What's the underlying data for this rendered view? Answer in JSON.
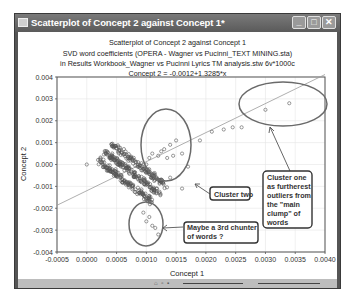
{
  "window": {
    "title": "Scatterplot of Concept 2 against Concept 1*",
    "controls": {
      "minimize": "_",
      "maximize": "□",
      "close": "✕"
    }
  },
  "header": {
    "line1": "Scatterplot of Concept 2 against Concept 1",
    "line2": "SVD word coefficients (OPERA - Wagner vs Pucinni_TEXT MINING.sta)",
    "line3": "in Results Workbook_Wagner vs Pucinni Lyrics TM analysis.stw 6v*1000c",
    "line4": "Concept 2 = -0.0012+1.3285*x"
  },
  "annotations": {
    "cluster_one": [
      "Cluster one",
      "as furtherest",
      "outliers from",
      "the \"main",
      "clump\" of",
      "words"
    ],
    "cluster_two": "Cluster two",
    "cluster_three": [
      "Maybe a 3rd chunter",
      "of words ?"
    ]
  },
  "colors": {
    "point": "#555555",
    "ellipse": "#6a6a6a",
    "fit_line": "#9a9a9a",
    "grid": "#e6e6e6"
  },
  "chart_data": {
    "type": "scatter",
    "title": "Scatterplot of Concept 2 against Concept 1",
    "subtitle": "SVD word coefficients (OPERA - Wagner vs Pucinni_TEXT MINING.sta) in Results Workbook_Wagner vs Pucinni Lyrics TM analysis.stw 6v*1000c",
    "fit_equation": "Concept 2 = -0.0012+1.3285*x",
    "fit": {
      "intercept": -0.0012,
      "slope": 1.3285
    },
    "xlabel": "Concept 1",
    "ylabel": "Concept 2",
    "xlim": [
      -0.0005,
      0.004
    ],
    "ylim": [
      -0.004,
      0.004
    ],
    "x_ticks": [
      "-0.0005",
      "0.0000",
      "0.0005",
      "0.0010",
      "0.0015",
      "0.0020",
      "0.0025",
      "0.0030",
      "0.0035",
      "0.0040"
    ],
    "y_ticks": [
      "0.004",
      "0.003",
      "0.002",
      "0.001",
      "0.000",
      "-0.001",
      "-0.002",
      "-0.003",
      "-0.004"
    ],
    "grid": true,
    "outlier_cluster_points": [
      [
        0.0019,
        0.0011
      ],
      [
        0.0021,
        0.0015
      ],
      [
        0.0023,
        0.0016
      ],
      [
        0.00245,
        0.0017
      ],
      [
        0.0026,
        0.0017
      ],
      [
        0.003,
        0.0025
      ],
      [
        0.0034,
        0.0028
      ]
    ],
    "cluster_two_points": [
      [
        0.001,
        0.0
      ],
      [
        0.00105,
        0.0003
      ],
      [
        0.0011,
        0.0005
      ],
      [
        0.0012,
        0.0004
      ],
      [
        0.00125,
        0.0006
      ],
      [
        0.0013,
        0.0007
      ],
      [
        0.00135,
        0.0003
      ],
      [
        0.0014,
        0.0009
      ],
      [
        0.00145,
        0.0004
      ],
      [
        0.0015,
        0.0011
      ],
      [
        0.0016,
        0.0005
      ],
      [
        0.0017,
        -0.0001
      ],
      [
        0.00125,
        -0.0007
      ],
      [
        0.0014,
        -0.0006
      ],
      [
        0.0016,
        -0.0011
      ]
    ],
    "cluster_three_points": [
      [
        0.00095,
        -0.0022
      ],
      [
        0.001,
        -0.0026
      ],
      [
        0.00105,
        -0.0024
      ],
      [
        0.0011,
        -0.0028
      ],
      [
        0.00115,
        -0.0029
      ],
      [
        0.0012,
        -0.0032
      ]
    ],
    "main_clump": {
      "description": "dense clump of several hundred points",
      "x_range": [
        0.0002,
        0.0011
      ],
      "y_range": [
        -0.0019,
        0.0003
      ]
    },
    "isolated_points": [
      [
        0.0,
        0.0
      ]
    ]
  }
}
